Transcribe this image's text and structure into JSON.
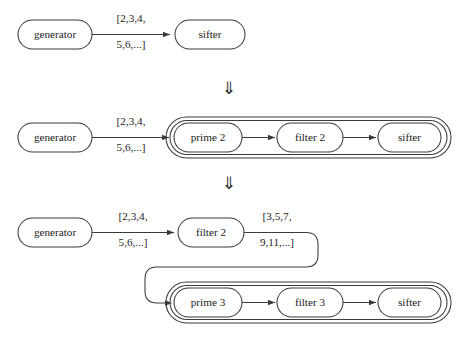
{
  "figure": {
    "stroke_color": "#3a3a3a",
    "text_color": "#1b1b1b",
    "background_color": "#ffffff",
    "separator_symbol": "⇓",
    "stages": [
      {
        "id": "stage-1",
        "nodes": [
          {
            "id": "generator",
            "label": "generator"
          },
          {
            "id": "sifter",
            "label": "sifter"
          }
        ],
        "edges": [
          {
            "id": "generator-to-sifter",
            "from": "generator",
            "to": "sifter",
            "label_line1": "[2,3,4,",
            "label_line2": "5,6,...]"
          }
        ],
        "groups": []
      },
      {
        "id": "stage-2",
        "nodes": [
          {
            "id": "generator",
            "label": "generator"
          },
          {
            "id": "prime-2",
            "label": "prime 2"
          },
          {
            "id": "filter-2",
            "label": "filter 2"
          },
          {
            "id": "sifter",
            "label": "sifter"
          }
        ],
        "edges": [
          {
            "id": "generator-to-prime-2",
            "from": "generator",
            "to": "prime-2",
            "label_line1": "[2,3,4,",
            "label_line2": "5,6,...]"
          },
          {
            "id": "prime-2-to-filter-2",
            "from": "prime-2",
            "to": "filter-2",
            "label_line1": "",
            "label_line2": ""
          },
          {
            "id": "filter-2-to-sifter",
            "from": "filter-2",
            "to": "sifter",
            "label_line1": "",
            "label_line2": ""
          }
        ],
        "groups": [
          {
            "id": "sifter-group-outer"
          },
          {
            "id": "sifter-group-inner"
          }
        ]
      },
      {
        "id": "stage-3",
        "nodes": [
          {
            "id": "generator",
            "label": "generator"
          },
          {
            "id": "filter-2",
            "label": "filter 2"
          },
          {
            "id": "prime-3",
            "label": "prime 3"
          },
          {
            "id": "filter-3",
            "label": "filter 3"
          },
          {
            "id": "sifter",
            "label": "sifter"
          }
        ],
        "edges": [
          {
            "id": "generator-to-filter-2",
            "from": "generator",
            "to": "filter-2",
            "label_line1": "[2,3,4,",
            "label_line2": "5,6,...]"
          },
          {
            "id": "filter-2-to-prime-3",
            "from": "filter-2",
            "to": "prime-3",
            "label_line1": "[3,5,7,",
            "label_line2": "9,11,...]"
          },
          {
            "id": "prime-3-to-filter-3",
            "from": "prime-3",
            "to": "filter-3",
            "label_line1": "",
            "label_line2": ""
          },
          {
            "id": "filter-3-to-sifter",
            "from": "filter-3",
            "to": "sifter",
            "label_line1": "",
            "label_line2": ""
          }
        ],
        "groups": [
          {
            "id": "sifter-group-outer"
          },
          {
            "id": "sifter-group-inner"
          }
        ]
      }
    ],
    "separators": [
      {
        "id": "separator-1",
        "symbol": "⇓"
      },
      {
        "id": "separator-2",
        "symbol": "⇓"
      }
    ]
  }
}
